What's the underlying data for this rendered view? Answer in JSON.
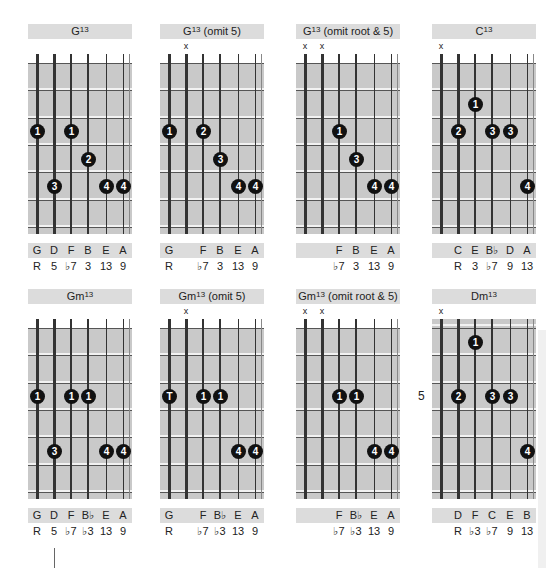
{
  "chart_data": [
    {
      "type": "chord",
      "name": "G13",
      "title_base": "G",
      "title_sup": "13",
      "title_suffix": "",
      "left": 28,
      "top": 24,
      "muted": [],
      "start_fret": 1,
      "show_nut": true,
      "dots": [
        {
          "string": 0,
          "fret": 3,
          "finger": "1"
        },
        {
          "string": 1,
          "fret": 5,
          "finger": "3"
        },
        {
          "string": 2,
          "fret": 3,
          "finger": "1"
        },
        {
          "string": 3,
          "fret": 4,
          "finger": "2"
        },
        {
          "string": 4,
          "fret": 5,
          "finger": "4"
        },
        {
          "string": 5,
          "fret": 5,
          "finger": "4"
        }
      ],
      "notes": [
        "G",
        "D",
        "F",
        "B",
        "E",
        "A"
      ],
      "intervals": [
        "R",
        "5",
        "♭7",
        "3",
        "13",
        "9"
      ]
    },
    {
      "type": "chord",
      "name": "G13 (omit 5)",
      "title_base": "G",
      "title_sup": "13",
      "title_suffix": " (omit 5)",
      "left": 160,
      "top": 24,
      "muted": [
        1
      ],
      "start_fret": 1,
      "show_nut": true,
      "dots": [
        {
          "string": 0,
          "fret": 3,
          "finger": "1"
        },
        {
          "string": 2,
          "fret": 3,
          "finger": "2"
        },
        {
          "string": 3,
          "fret": 4,
          "finger": "3"
        },
        {
          "string": 4,
          "fret": 5,
          "finger": "4"
        },
        {
          "string": 5,
          "fret": 5,
          "finger": "4"
        }
      ],
      "notes": [
        "G",
        "",
        "F",
        "B",
        "E",
        "A"
      ],
      "intervals": [
        "R",
        "",
        "♭7",
        "3",
        "13",
        "9"
      ]
    },
    {
      "type": "chord",
      "name": "G13 (omit root & 5)",
      "title_base": "G",
      "title_sup": "13",
      "title_suffix": " (omit root & 5)",
      "left": 296,
      "top": 24,
      "muted": [
        0,
        1
      ],
      "start_fret": 1,
      "show_nut": true,
      "dots": [
        {
          "string": 2,
          "fret": 3,
          "finger": "1"
        },
        {
          "string": 3,
          "fret": 4,
          "finger": "3"
        },
        {
          "string": 4,
          "fret": 5,
          "finger": "4"
        },
        {
          "string": 5,
          "fret": 5,
          "finger": "4"
        }
      ],
      "notes": [
        "",
        "",
        "F",
        "B",
        "E",
        "A"
      ],
      "intervals": [
        "",
        "",
        "♭7",
        "3",
        "13",
        "9"
      ]
    },
    {
      "type": "chord",
      "name": "C13",
      "title_base": "C",
      "title_sup": "13",
      "title_suffix": "",
      "left": 432,
      "top": 24,
      "muted": [
        0
      ],
      "start_fret": 1,
      "show_nut": true,
      "dots": [
        {
          "string": 1,
          "fret": 3,
          "finger": "2"
        },
        {
          "string": 2,
          "fret": 2,
          "finger": "1"
        },
        {
          "string": 3,
          "fret": 3,
          "finger": "3"
        },
        {
          "string": 4,
          "fret": 3,
          "finger": "3"
        },
        {
          "string": 5,
          "fret": 5,
          "finger": "4"
        }
      ],
      "notes": [
        "",
        "C",
        "E",
        "B♭",
        "D",
        "A"
      ],
      "intervals": [
        "",
        "R",
        "3",
        "♭7",
        "9",
        "13"
      ]
    },
    {
      "type": "chord",
      "name": "Gm13",
      "title_base": "Gm",
      "title_sup": "13",
      "title_suffix": "",
      "left": 28,
      "top": 289,
      "muted": [],
      "start_fret": 1,
      "show_nut": true,
      "dots": [
        {
          "string": 0,
          "fret": 3,
          "finger": "1"
        },
        {
          "string": 1,
          "fret": 5,
          "finger": "3"
        },
        {
          "string": 2,
          "fret": 3,
          "finger": "1"
        },
        {
          "string": 3,
          "fret": 3,
          "finger": "1"
        },
        {
          "string": 4,
          "fret": 5,
          "finger": "4"
        },
        {
          "string": 5,
          "fret": 5,
          "finger": "4"
        }
      ],
      "notes": [
        "G",
        "D",
        "F",
        "B♭",
        "E",
        "A"
      ],
      "intervals": [
        "R",
        "5",
        "♭7",
        "♭3",
        "13",
        "9"
      ]
    },
    {
      "type": "chord",
      "name": "Gm13 (omit 5)",
      "title_base": "Gm",
      "title_sup": "13",
      "title_suffix": " (omit 5)",
      "left": 160,
      "top": 289,
      "muted": [
        1
      ],
      "start_fret": 1,
      "show_nut": true,
      "dots": [
        {
          "string": 0,
          "fret": 3,
          "finger": "T"
        },
        {
          "string": 2,
          "fret": 3,
          "finger": "1"
        },
        {
          "string": 3,
          "fret": 3,
          "finger": "1"
        },
        {
          "string": 4,
          "fret": 5,
          "finger": "4"
        },
        {
          "string": 5,
          "fret": 5,
          "finger": "4"
        }
      ],
      "notes": [
        "G",
        "",
        "F",
        "B♭",
        "E",
        "A"
      ],
      "intervals": [
        "R",
        "",
        "♭7",
        "♭3",
        "13",
        "9"
      ]
    },
    {
      "type": "chord",
      "name": "Gm13 (omit root & 5)",
      "title_base": "Gm",
      "title_sup": "13",
      "title_suffix": " (omit root & 5)",
      "left": 296,
      "top": 289,
      "muted": [
        0,
        1
      ],
      "start_fret": 1,
      "show_nut": true,
      "dots": [
        {
          "string": 2,
          "fret": 3,
          "finger": "1"
        },
        {
          "string": 3,
          "fret": 3,
          "finger": "1"
        },
        {
          "string": 4,
          "fret": 5,
          "finger": "4"
        },
        {
          "string": 5,
          "fret": 5,
          "finger": "4"
        }
      ],
      "notes": [
        "",
        "",
        "F",
        "B♭",
        "E",
        "A"
      ],
      "intervals": [
        "",
        "",
        "♭7",
        "♭3",
        "13",
        "9"
      ]
    },
    {
      "type": "chord",
      "name": "Dm13",
      "title_base": "Dm",
      "title_sup": "13",
      "title_suffix": "",
      "left": 432,
      "top": 289,
      "muted": [
        0
      ],
      "start_fret": 3,
      "fret_label": "5",
      "show_nut": false,
      "dots": [
        {
          "string": 1,
          "fret": 3,
          "finger": "2"
        },
        {
          "string": 2,
          "fret": 1,
          "finger": "1"
        },
        {
          "string": 3,
          "fret": 3,
          "finger": "3"
        },
        {
          "string": 4,
          "fret": 3,
          "finger": "3"
        },
        {
          "string": 5,
          "fret": 5,
          "finger": "4"
        }
      ],
      "notes": [
        "",
        "D",
        "F",
        "C",
        "E",
        "B"
      ],
      "intervals": [
        "",
        "R",
        "♭3",
        "♭7",
        "9",
        "13"
      ]
    }
  ],
  "mute_symbol": "x"
}
